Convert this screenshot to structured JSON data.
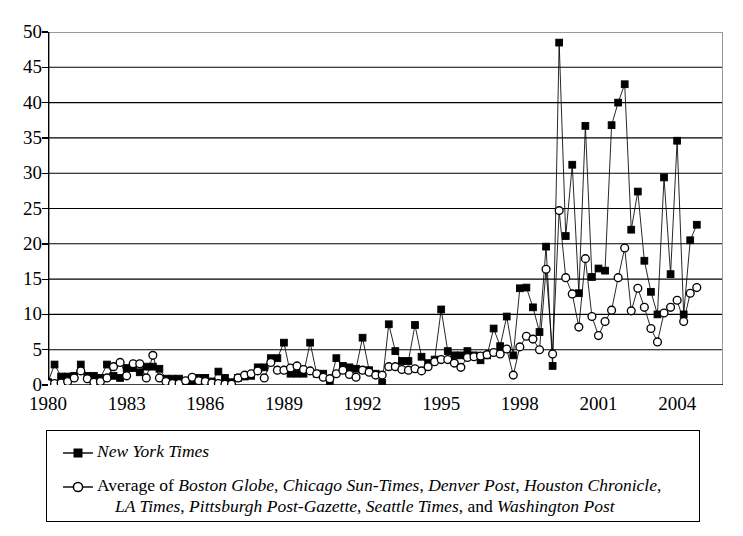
{
  "chart_data": {
    "type": "line",
    "title": "",
    "xlabel": "",
    "ylabel": "",
    "xlim": [
      1980,
      2005.75
    ],
    "ylim": [
      0,
      50
    ],
    "ytick_interval": 5,
    "yticks": [
      0,
      5,
      10,
      15,
      20,
      25,
      30,
      35,
      40,
      45,
      50
    ],
    "xticks": [
      1980,
      1983,
      1986,
      1989,
      1992,
      1995,
      1998,
      2001,
      2004
    ],
    "xtick_labels": [
      "1980",
      "1983",
      "1986",
      "1989",
      "1992",
      "1995",
      "1998",
      "2001",
      "2004"
    ],
    "grid": "horizontal",
    "legend_position": "below-plot",
    "x_interval_years": 0.25,
    "x_start": 1980.0,
    "series": [
      {
        "name": "New York Times",
        "marker": "filled-square",
        "line_color": "#000000",
        "values": [
          0.4,
          2.9,
          1.2,
          1.2,
          1.3,
          2.9,
          1.3,
          1.3,
          1.0,
          2.9,
          1.3,
          1.0,
          2.4,
          2.4,
          1.8,
          2.6,
          2.6,
          2.3,
          0.9,
          0.9,
          0.9,
          0.3,
          0.4,
          1.0,
          1.0,
          0.5,
          1.9,
          1.0,
          0.4,
          1.0,
          1.2,
          1.3,
          2.5,
          2.5,
          3.8,
          3.8,
          6.0,
          1.6,
          1.6,
          1.6,
          6.0,
          1.6,
          1.6,
          0.2,
          3.8,
          2.7,
          2.5,
          2.3,
          6.7,
          2.1,
          1.6,
          0.3,
          8.6,
          4.8,
          3.4,
          3.4,
          8.5,
          4.0,
          3.1,
          3.6,
          10.7,
          4.8,
          4.2,
          4.2,
          4.8,
          4.2,
          3.5,
          4.2,
          8.0,
          5.5,
          9.7,
          4.2,
          13.7,
          13.8,
          11.0,
          7.5,
          19.6,
          2.7,
          48.5,
          21.1,
          31.2,
          13.0,
          36.7,
          15.3,
          16.5,
          16.2,
          36.8,
          40.0,
          42.6,
          22.0,
          27.4,
          17.6,
          13.2,
          10.0,
          29.4,
          15.7,
          34.6,
          10.0,
          20.5,
          22.7
        ]
      },
      {
        "name": "Average of Boston Globe, Chicago Sun-Times, Denver Post, Houston Chronicle, LA Times, Pittsburgh Post-Gazette, Seattle Times, and Washington Post",
        "marker": "open-circle",
        "line_color": "#000000",
        "values": [
          0.2,
          0.2,
          0.3,
          0.5,
          1.0,
          2.0,
          0.9,
          0.4,
          0.5,
          1.0,
          2.6,
          3.2,
          1.3,
          3.0,
          3.0,
          1.0,
          4.2,
          1.0,
          0.5,
          0.2,
          0.2,
          0.6,
          1.1,
          0.6,
          0.5,
          0.3,
          0.2,
          0.1,
          0.1,
          1.0,
          1.4,
          1.6,
          2.0,
          1.0,
          3.2,
          2.1,
          2.1,
          2.4,
          2.7,
          2.2,
          2.0,
          1.6,
          1.1,
          0.9,
          1.6,
          2.1,
          1.5,
          1.1,
          2.1,
          1.8,
          1.4,
          1.4,
          2.6,
          2.6,
          2.2,
          2.1,
          2.3,
          2.0,
          2.6,
          3.3,
          3.6,
          3.6,
          3.1,
          2.5,
          3.9,
          4.0,
          4.1,
          4.3,
          4.6,
          4.4,
          5.1,
          1.4,
          5.4,
          6.9,
          6.5,
          5.0,
          16.4,
          4.4,
          24.7,
          15.2,
          12.9,
          8.2,
          17.9,
          9.7,
          7.0,
          9.0,
          10.6,
          15.2,
          19.4,
          10.5,
          13.7,
          11.0,
          8.0,
          6.1,
          10.2,
          11.0,
          12.0,
          9.0,
          13.0,
          13.8
        ]
      }
    ]
  },
  "legend": {
    "row1": {
      "label_italic": "New York Times",
      "marker": "filled-square-line"
    },
    "row2": {
      "marker": "open-circle-line",
      "prefix": "Average of ",
      "papers_line1": [
        "Boston Globe",
        "Chicago Sun-Times",
        "Denver Post",
        "Houston Chronicle"
      ],
      "papers_line2": [
        "LA Times",
        "Pittsburgh Post-Gazette",
        "Seattle Times"
      ],
      "conjunction": "and ",
      "last_paper": "Washington Post",
      "line1_text": "Average of Boston Globe, Chicago Sun-Times, Denver Post, Houston Chronicle,",
      "line2_text": "LA Times, Pittsburgh Post-Gazette, Seattle Times, and Washington Post"
    }
  },
  "colors": {
    "axis": "#000000",
    "grid": "#000000",
    "marker_fill_series1": "#000000",
    "marker_fill_series2": "#ffffff",
    "background": "#ffffff"
  }
}
